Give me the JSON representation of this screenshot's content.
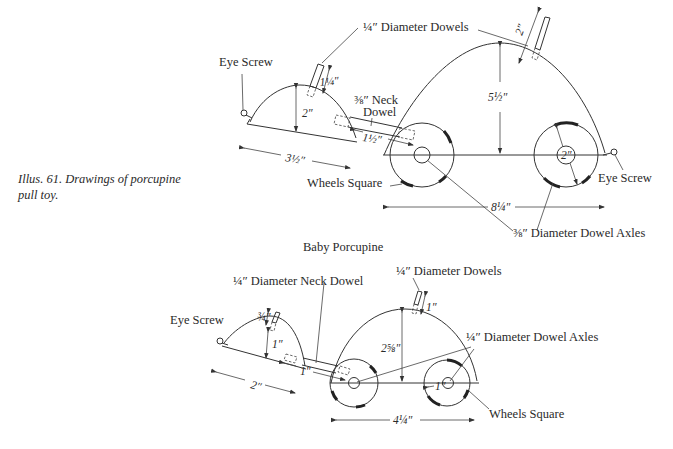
{
  "caption": {
    "line1": "Illus. 61. Drawings of porcupine",
    "line2": "pull toy."
  },
  "large_porcupine": {
    "labels": {
      "eye_screw_left": "Eye Screw",
      "eye_screw_right": "Eye Screw",
      "dowels": "¼″ Diameter Dowels",
      "neck_dowel_line1": "⅜″ Neck",
      "neck_dowel_line2": "Dowel",
      "wheels_square": "Wheels Square",
      "axles": "⅜″ Diameter Dowel Axles"
    },
    "dimensions": {
      "head_quill_length": "1¼″",
      "head_height": "2″",
      "head_length": "3½″",
      "neck_dowel_length": "1½″",
      "body_height": "5½″",
      "body_length": "8¼″",
      "body_quill_length": "2″",
      "wheel_diameter": "2″"
    }
  },
  "baby_porcupine": {
    "title": "Baby Porcupine",
    "labels": {
      "eye_screw": "Eye Screw",
      "neck_dowel": "¼″ Diameter Neck Dowel",
      "dowels": "¼″ Diameter Dowels",
      "axles": "¼″ Diameter Dowel Axles",
      "wheels_square": "Wheels Square"
    },
    "dimensions": {
      "head_quill_length": "¾″",
      "head_height": "1″",
      "head_length": "2″",
      "neck_dowel_length": "1″",
      "body_height": "2⅝″",
      "body_length": "4¼″",
      "body_quill_length": "1″",
      "wheel_diameter": "1″"
    }
  }
}
